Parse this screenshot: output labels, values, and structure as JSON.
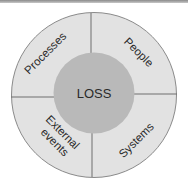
{
  "diagram": {
    "type": "concentric-segmented-circle",
    "center": {
      "label": "LOSS"
    },
    "segments": [
      {
        "position": "top-left",
        "label": "Processes"
      },
      {
        "position": "top-right",
        "label": "People"
      },
      {
        "position": "bottom-left",
        "label_line1": "External",
        "label_line2": "events"
      },
      {
        "position": "bottom-right",
        "label": "Systems"
      }
    ],
    "colors": {
      "outer_ring": "#e2e2e2",
      "inner_circle": "#b9b9b9",
      "lines": "#6e6e6e",
      "text": "#2a2a2a"
    }
  }
}
